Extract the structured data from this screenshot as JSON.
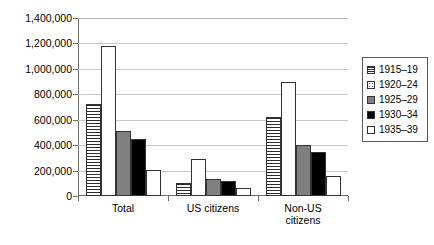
{
  "chart_data": {
    "type": "bar",
    "title": "",
    "xlabel": "",
    "ylabel": "",
    "ylim": [
      0,
      1400000
    ],
    "ytick_values": [
      0,
      200000,
      400000,
      600000,
      800000,
      1000000,
      1200000,
      1400000
    ],
    "ytick_labels": [
      "0",
      "200,000",
      "400,000",
      "600,000",
      "800,000",
      "1,000,000",
      "1,200,000",
      "1,400,000"
    ],
    "grid": true,
    "legend_position": "right",
    "categories": [
      "Total",
      "US citizens",
      "Non-US citizens"
    ],
    "series": [
      {
        "name": "1915–19",
        "pattern": "p-hlines",
        "values": [
          720000,
          100000,
          620000
        ]
      },
      {
        "name": "1920–24",
        "pattern": "p-dots",
        "values": [
          1180000,
          290000,
          900000
        ]
      },
      {
        "name": "1925–29",
        "pattern": "p-gray",
        "values": [
          510000,
          130000,
          400000
        ]
      },
      {
        "name": "1930–34",
        "pattern": "p-black",
        "values": [
          450000,
          115000,
          345000
        ]
      },
      {
        "name": "1935–39",
        "pattern": "p-white",
        "values": [
          205000,
          60000,
          155000
        ]
      }
    ]
  },
  "colors": {
    "axis": "#6e6e6e",
    "grid": "#c8c8c8",
    "gray_series": "#808080",
    "black_series": "#000000",
    "white_series": "#ffffff",
    "legend_border": "#5a5a5a"
  }
}
